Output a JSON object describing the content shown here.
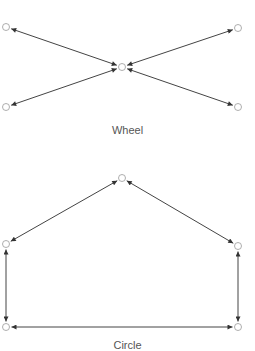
{
  "diagrams": [
    {
      "name": "Wheel",
      "label": "Wheel",
      "nodes": [
        {
          "id": "center",
          "x": 122,
          "y": 67
        },
        {
          "id": "top-left",
          "x": 6,
          "y": 27
        },
        {
          "id": "top-right",
          "x": 238,
          "y": 28
        },
        {
          "id": "bottom-left",
          "x": 6,
          "y": 107
        },
        {
          "id": "bottom-right",
          "x": 238,
          "y": 107
        }
      ],
      "edges": [
        [
          "center",
          "top-left"
        ],
        [
          "center",
          "top-right"
        ],
        [
          "center",
          "bottom-left"
        ],
        [
          "center",
          "bottom-right"
        ]
      ]
    },
    {
      "name": "Circle",
      "label": "Circle",
      "nodes": [
        {
          "id": "top",
          "x": 122,
          "y": 178
        },
        {
          "id": "left",
          "x": 6,
          "y": 244
        },
        {
          "id": "right",
          "x": 238,
          "y": 246
        },
        {
          "id": "bottom-left",
          "x": 6,
          "y": 327
        },
        {
          "id": "bottom-right",
          "x": 238,
          "y": 327
        }
      ],
      "edges": [
        [
          "top",
          "left"
        ],
        [
          "top",
          "right"
        ],
        [
          "left",
          "bottom-left"
        ],
        [
          "right",
          "bottom-right"
        ],
        [
          "bottom-left",
          "bottom-right"
        ]
      ]
    }
  ],
  "style": {
    "edge_color": "#444444",
    "node_stroke": "#999999",
    "label_color": "#555555"
  }
}
